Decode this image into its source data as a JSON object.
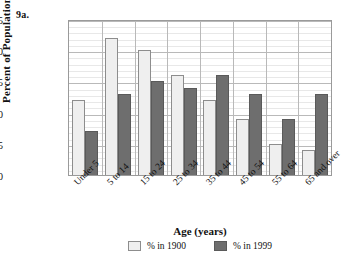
{
  "figure_label": "9a.",
  "chart_data": {
    "type": "bar",
    "title": "",
    "xlabel": "Age (years)",
    "ylabel": "Percent of Population",
    "ylim": [
      0,
      25
    ],
    "ytick_values": [
      0,
      5,
      10,
      15,
      20,
      25
    ],
    "ytick_labels": [
      "0",
      "5",
      "10",
      "15",
      "20",
      "25"
    ],
    "minor_tick_step": 1,
    "grid": true,
    "legend_position": "bottom-center",
    "categories": [
      "Under 5",
      "5 to 14",
      "15 to 24",
      "25 to 34",
      "35 to 44",
      "45 to 54",
      "55 to 64",
      "65 and over"
    ],
    "series": [
      {
        "name": "% in 1900",
        "color": "#efefef",
        "values": [
          12,
          22,
          20,
          16,
          12,
          9,
          5,
          4
        ]
      },
      {
        "name": "% in 1999",
        "color": "#6e6e6e",
        "values": [
          7,
          13,
          15,
          14,
          16,
          13,
          9,
          13
        ]
      }
    ]
  },
  "legend": {
    "items": [
      {
        "label": "% in 1900"
      },
      {
        "label": "% in 1999"
      }
    ]
  }
}
